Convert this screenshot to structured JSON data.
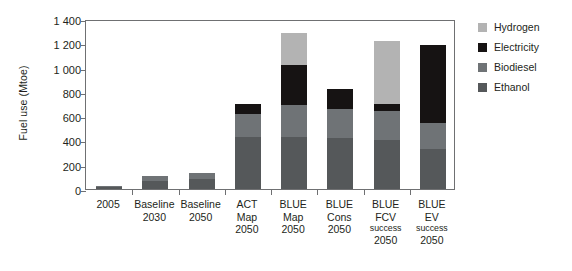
{
  "chart_data": {
    "type": "bar",
    "title": "",
    "subtitle": "",
    "stacked": true,
    "xlabel": "",
    "ylabel": "Fuel use (Mtoe)",
    "ylim": [
      0,
      1400
    ],
    "yticks": [
      "0",
      "200",
      "400",
      "600",
      "800",
      "1 000",
      "1 200",
      "1 400"
    ],
    "ytick_values": [
      0,
      200,
      400,
      600,
      800,
      1000,
      1200,
      1400
    ],
    "grid": false,
    "legend_position": "right",
    "categories": [
      "2005",
      "Baseline 2030",
      "Baseline 2050",
      "ACT Map 2050",
      "BLUE Map 2050",
      "BLUE Cons 2050",
      "BLUE FCV success 2050",
      "BLUE EV success 2050"
    ],
    "category_labels": [
      {
        "lines": [
          "2005"
        ],
        "small_lines": []
      },
      {
        "lines": [
          "Baseline",
          "2030"
        ],
        "small_lines": []
      },
      {
        "lines": [
          "Baseline",
          "2050"
        ],
        "small_lines": []
      },
      {
        "lines": [
          "ACT",
          "Map",
          "2050"
        ],
        "small_lines": []
      },
      {
        "lines": [
          "BLUE",
          "Map",
          "2050"
        ],
        "small_lines": []
      },
      {
        "lines": [
          "BLUE",
          "Cons",
          "2050"
        ],
        "small_lines": []
      },
      {
        "lines": [
          "BLUE",
          "FCV"
        ],
        "small_lines": [
          "success"
        ],
        "tail_lines": [
          "2050"
        ]
      },
      {
        "lines": [
          "BLUE",
          "EV"
        ],
        "small_lines": [
          "success"
        ],
        "tail_lines": [
          "2050"
        ]
      }
    ],
    "series": [
      {
        "name": "Ethanol",
        "color": "#55585a",
        "values": [
          15,
          70,
          85,
          430,
          430,
          420,
          400,
          330
        ]
      },
      {
        "name": "Biodiesel",
        "color": "#6f7376",
        "values": [
          10,
          35,
          50,
          190,
          260,
          240,
          240,
          215
        ]
      },
      {
        "name": "Electricity",
        "color": "#161313",
        "values": [
          0,
          0,
          0,
          80,
          330,
          165,
          60,
          645
        ]
      },
      {
        "name": "Hydrogen",
        "color": "#b3b3b3",
        "values": [
          0,
          0,
          0,
          0,
          265,
          0,
          515,
          0
        ]
      }
    ],
    "stack_order": [
      "Ethanol",
      "Biodiesel",
      "Electricity",
      "Hydrogen"
    ],
    "totals": [
      25,
      105,
      135,
      700,
      1285,
      825,
      1215,
      1190
    ]
  },
  "legend": {
    "items": [
      {
        "label": "Hydrogen",
        "color": "#b3b3b3"
      },
      {
        "label": "Electricity",
        "color": "#161313"
      },
      {
        "label": "Biodiesel",
        "color": "#6f7376"
      },
      {
        "label": "Ethanol",
        "color": "#55585a"
      }
    ]
  },
  "colors": {
    "axis": "#6f7072",
    "text": "#231f20",
    "background": "#ffffff"
  }
}
